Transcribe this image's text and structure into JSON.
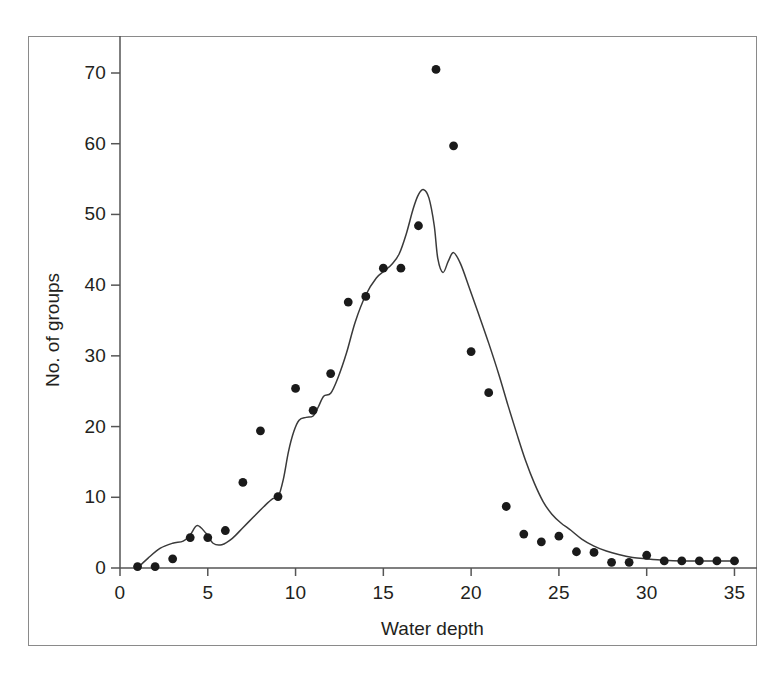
{
  "chart_data": {
    "type": "scatter",
    "title": "",
    "xlabel": "Water depth",
    "ylabel": "No. of groups",
    "xlim": [
      0,
      35.6
    ],
    "ylim": [
      0,
      74
    ],
    "xticks": [
      0,
      5,
      10,
      15,
      20,
      25,
      30,
      35
    ],
    "xtick_labels": [
      "0",
      "5",
      "10",
      "15",
      "20",
      "25",
      "30",
      "35"
    ],
    "yticks": [
      0,
      10,
      20,
      30,
      40,
      50,
      60,
      70
    ],
    "ytick_labels": [
      "0",
      "10",
      "20",
      "30",
      "40",
      "50",
      "60",
      "70"
    ],
    "grid": false,
    "legend": "none",
    "marker": "filled-circle",
    "marker_color": "#1a1a1a",
    "line_color": "#3a3a3a",
    "frame_color": "#8a8a8a",
    "series": [
      {
        "name": "No. of groups (observed)",
        "type": "scatter",
        "x": [
          1,
          2,
          3,
          4,
          5,
          6,
          7,
          8,
          9,
          10,
          11,
          12,
          13,
          14,
          15,
          16,
          17,
          18,
          19,
          20,
          21,
          22,
          23,
          24,
          25,
          26,
          27,
          28,
          29,
          30,
          31,
          32,
          33,
          34,
          35
        ],
        "y": [
          0.2,
          0.2,
          1.3,
          4.3,
          4.3,
          5.3,
          12.1,
          19.4,
          10.1,
          25.4,
          22.3,
          27.5,
          37.6,
          38.4,
          42.4,
          42.4,
          48.4,
          70.5,
          59.7,
          30.6,
          24.8,
          8.7,
          4.8,
          3.7,
          4.5,
          2.3,
          2.2,
          0.8,
          0.8,
          1.8,
          1.0,
          1.0,
          1.0,
          1.0,
          1.0
        ]
      },
      {
        "name": "Fitted curve",
        "type": "line",
        "x": [
          1.0,
          1.6,
          2.3,
          3.0,
          3.6,
          4.0,
          4.4,
          4.9,
          5.3,
          5.8,
          6.4,
          7.0,
          7.6,
          8.2,
          8.7,
          9.0,
          9.3,
          9.6,
          9.9,
          10.2,
          10.6,
          11.0,
          11.3,
          11.6,
          12.0,
          12.4,
          12.9,
          13.4,
          14.0,
          14.6,
          15.1,
          15.5,
          15.9,
          16.3,
          16.7,
          17.0,
          17.3,
          17.6,
          17.9,
          18.1,
          18.4,
          18.7,
          19.0,
          19.4,
          19.9,
          20.4,
          21.0,
          21.6,
          22.1,
          22.6,
          23.1,
          23.6,
          24.1,
          24.6,
          25.1,
          25.7,
          26.3,
          27.0,
          27.7,
          28.4,
          29.2,
          30.0,
          31.0,
          32.0,
          33.0,
          34.0,
          35.2
        ],
        "y": [
          0.0,
          1.4,
          2.8,
          3.5,
          3.8,
          4.7,
          6.0,
          4.9,
          3.5,
          3.3,
          4.2,
          5.7,
          7.2,
          8.7,
          9.8,
          10.0,
          12.5,
          16.5,
          19.3,
          20.9,
          21.3,
          21.5,
          22.8,
          24.3,
          24.7,
          26.8,
          30.4,
          34.8,
          38.6,
          41.0,
          42.1,
          43.0,
          44.4,
          47.2,
          50.8,
          52.8,
          53.5,
          52.3,
          48.4,
          43.8,
          41.8,
          43.4,
          44.6,
          43.0,
          39.6,
          36.1,
          31.8,
          27.2,
          23.0,
          19.0,
          15.2,
          12.0,
          9.4,
          7.6,
          6.4,
          5.3,
          4.1,
          3.1,
          2.4,
          1.9,
          1.5,
          1.3,
          1.1,
          1.0,
          1.0,
          1.0,
          1.0
        ]
      }
    ]
  }
}
